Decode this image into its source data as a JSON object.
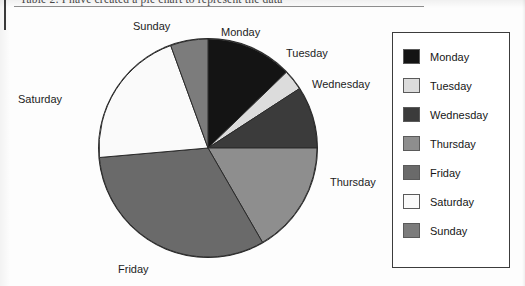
{
  "caption": {
    "text": "Table 2: I have created a pie chart to represent the data",
    "note": "cropped at top of scan"
  },
  "chart_data": {
    "type": "pie",
    "title": "",
    "labels": [
      "Monday",
      "Tuesday",
      "Wednesday",
      "Thursday",
      "Friday",
      "Saturday",
      "Sunday"
    ],
    "values": [
      12.8,
      3.1,
      9.2,
      16.7,
      31.9,
      20.8,
      5.5
    ],
    "start_angle_deg": 0,
    "direction": "clockwise",
    "slice_angles_deg": [
      46,
      11,
      33,
      60,
      115,
      75,
      20
    ],
    "colors": [
      "#141414",
      "#dcdcdc",
      "#3b3b3b",
      "#8e8e8e",
      "#6a6a6a",
      "#fafafa",
      "#7c7c7c"
    ],
    "slices": [
      {
        "label": "Monday",
        "value": 12.8,
        "angle_deg": 46,
        "color": "#141414",
        "label_position": "top"
      },
      {
        "label": "Tuesday",
        "value": 3.1,
        "angle_deg": 11,
        "color": "#dcdcdc",
        "label_position": "upper-right"
      },
      {
        "label": "Wednesday",
        "value": 9.2,
        "angle_deg": 33,
        "color": "#3b3b3b",
        "label_position": "right"
      },
      {
        "label": "Thursday",
        "value": 16.7,
        "angle_deg": 60,
        "color": "#8e8e8e",
        "label_position": "lower-right"
      },
      {
        "label": "Friday",
        "value": 31.9,
        "angle_deg": 115,
        "color": "#6a6a6a",
        "label_position": "bottom"
      },
      {
        "label": "Saturday",
        "value": 20.8,
        "angle_deg": 75,
        "color": "#fafafa",
        "label_position": "left"
      },
      {
        "label": "Sunday",
        "value": 5.5,
        "angle_deg": 20,
        "color": "#7c7c7c",
        "label_position": "top-left"
      }
    ],
    "legend": {
      "position": "right",
      "entries": [
        {
          "label": "Monday",
          "color": "#141414"
        },
        {
          "label": "Tuesday",
          "color": "#dcdcdc"
        },
        {
          "label": "Wednesday",
          "color": "#3b3b3b"
        },
        {
          "label": "Thursday",
          "color": "#8e8e8e"
        },
        {
          "label": "Friday",
          "color": "#6a6a6a"
        },
        {
          "label": "Saturday",
          "color": "#fafafa"
        },
        {
          "label": "Sunday",
          "color": "#7c7c7c"
        }
      ]
    },
    "grid": false,
    "xlabel": "",
    "ylabel": ""
  },
  "pie_geometry": {
    "center_x": 110,
    "center_y": 110,
    "radius": 109,
    "stroke": "#2a2a2a"
  }
}
